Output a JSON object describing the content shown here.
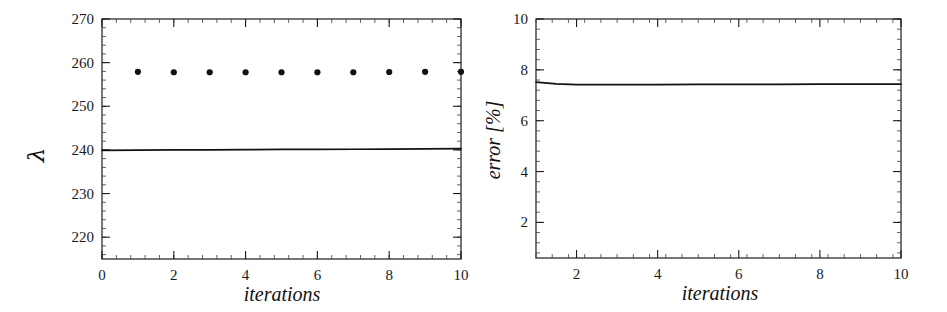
{
  "figure": {
    "background": "#ffffff",
    "ink_color": "#111111",
    "panel_count": 2
  },
  "chart_data": [
    {
      "type": "scatter",
      "title": "",
      "panel_name": "eigenvalue-convergence",
      "xlabel": "iterations",
      "ylabel": "λ",
      "xlim": [
        0,
        10
      ],
      "ylim": [
        215,
        270
      ],
      "grid": false,
      "legend": null,
      "x_ticks": [
        0,
        2,
        4,
        6,
        8,
        10
      ],
      "x_tick_labels": [
        "0",
        "2",
        "4",
        "6",
        "8",
        "10"
      ],
      "x_minor_step": 0.4,
      "y_ticks": [
        220,
        230,
        240,
        250,
        260,
        270
      ],
      "y_tick_labels": [
        "220",
        "230",
        "240",
        "250",
        "260",
        "270"
      ],
      "y_minor_step": 2,
      "series": [
        {
          "name": "computed eigenvalue",
          "style": "points",
          "marker": "filled-circle",
          "x": [
            1,
            2,
            3,
            4,
            5,
            6,
            7,
            8,
            9,
            10
          ],
          "values": [
            257.9,
            257.8,
            257.8,
            257.8,
            257.8,
            257.8,
            257.8,
            257.85,
            257.9,
            257.9
          ]
        },
        {
          "name": "reference eigenvalue",
          "style": "line",
          "x": [
            0,
            1,
            2,
            3,
            4,
            5,
            6,
            7,
            8,
            9,
            10
          ],
          "values": [
            239.9,
            239.95,
            240.0,
            240.0,
            240.05,
            240.1,
            240.1,
            240.15,
            240.2,
            240.25,
            240.3
          ]
        }
      ]
    },
    {
      "type": "line",
      "title": "",
      "panel_name": "relative-error",
      "xlabel": "iterations",
      "ylabel": "error [%]",
      "xlim": [
        1,
        10
      ],
      "ylim": [
        0.6,
        10
      ],
      "grid": false,
      "legend": null,
      "x_ticks": [
        2,
        4,
        6,
        8,
        10
      ],
      "x_tick_labels": [
        "2",
        "4",
        "6",
        "8",
        "10"
      ],
      "x_minor_step": 0.4,
      "y_ticks": [
        2,
        4,
        6,
        8,
        10
      ],
      "y_tick_labels": [
        "2",
        "4",
        "6",
        "8",
        "10"
      ],
      "y_minor_step": 0.4,
      "series": [
        {
          "name": "error",
          "style": "line",
          "x": [
            1,
            1.5,
            2,
            3,
            4,
            5,
            6,
            7,
            8,
            9,
            10
          ],
          "values": [
            7.52,
            7.45,
            7.42,
            7.42,
            7.42,
            7.43,
            7.43,
            7.43,
            7.44,
            7.44,
            7.44
          ]
        }
      ]
    }
  ]
}
